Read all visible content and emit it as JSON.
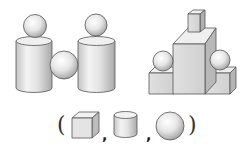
{
  "figure": {
    "left_composite": {
      "label": "cylinders-and-spheres",
      "parts": [
        "sphere",
        "cylinder",
        "sphere",
        "sphere",
        "cylinder"
      ]
    },
    "right_composite": {
      "label": "boxes-and-spheres",
      "parts": [
        "small-box",
        "tall-box",
        "low-box-left",
        "low-box-right",
        "sphere-left",
        "sphere-right"
      ]
    },
    "answer_prompt": {
      "open_paren": "(",
      "separator_1": ",",
      "separator_2": ",",
      "close_paren": ")",
      "shapes": [
        "cube",
        "cylinder",
        "sphere"
      ]
    }
  }
}
